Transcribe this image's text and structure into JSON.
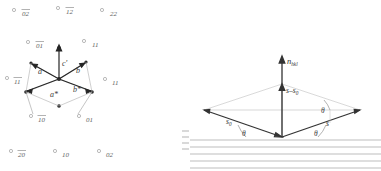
{
  "figure": {
    "ink_color": "#2b2b2b",
    "faint_color": "#9a9a9a",
    "background": "#ffffff"
  },
  "left_panel": {
    "name": "reciprocal lattice construction",
    "origin_label": "",
    "vectors": [
      {
        "id": "a",
        "label": "a"
      },
      {
        "id": "b",
        "label": "b"
      },
      {
        "id": "a_star",
        "label": "a*"
      },
      {
        "id": "b_star",
        "label": "b*"
      },
      {
        "id": "c_prime",
        "label": "c'"
      }
    ],
    "lattice_point_labels": [
      {
        "id": "p-02-top-left",
        "label": "02",
        "overline": true,
        "x": 22,
        "y": 16
      },
      {
        "id": "p-12-top-mid",
        "label": "12",
        "overline": true,
        "x": 66,
        "y": 14
      },
      {
        "id": "p-22-top-right",
        "label": "22",
        "overline": false,
        "x": 110,
        "y": 16
      },
      {
        "id": "p-01-left",
        "label": "01",
        "overline": true,
        "x": 36,
        "y": 48
      },
      {
        "id": "p-11-right",
        "label": "11",
        "overline": false,
        "x": 92,
        "y": 47
      },
      {
        "id": "p-11-far-left",
        "label": "11",
        "overline": true,
        "x": 14,
        "y": 84
      },
      {
        "id": "p-11-far-right",
        "label": "11",
        "overline": false,
        "x": 112,
        "y": 85
      },
      {
        "id": "p-10-bottom-left",
        "label": "10",
        "overline": true,
        "x": 38,
        "y": 122
      },
      {
        "id": "p-01-bottom-right",
        "label": "01",
        "overline": false,
        "x": 86,
        "y": 122
      },
      {
        "id": "p-20-bot-left",
        "label": "20",
        "overline": true,
        "x": 18,
        "y": 157
      },
      {
        "id": "p-10-bot-mid",
        "label": "10",
        "overline": false,
        "x": 62,
        "y": 157
      },
      {
        "id": "p-02-bot-right",
        "label": "02",
        "overline": false,
        "x": 106,
        "y": 157
      }
    ]
  },
  "right_panel": {
    "name": "Bragg scattering vector diagram",
    "labels": {
      "normal": "n",
      "normal_sub": "hkl",
      "scattering_difference": "s–s",
      "scattering_difference_sub": "0",
      "incident": "s",
      "incident_sub": "0",
      "diffracted": "s",
      "angle": "θ"
    },
    "angles": [
      {
        "id": "theta-incident-lower",
        "label": "θ"
      },
      {
        "id": "theta-diffracted-lower",
        "label": "θ"
      },
      {
        "id": "theta-diffracted-upper",
        "label": "θ"
      }
    ],
    "lattice_planes_count": 5
  }
}
